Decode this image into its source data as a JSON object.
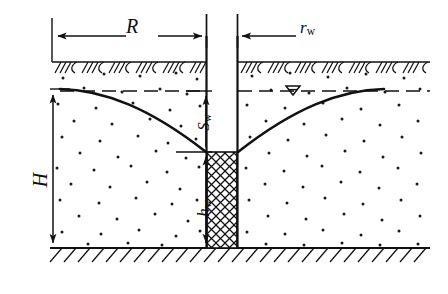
{
  "figure": {
    "type": "engineering-cross-section-diagram",
    "labels": {
      "radius_of_influence": "R",
      "well_radius_symbol": "r",
      "well_radius_subscript": "w",
      "aquifer_thickness": "H",
      "drawdown_symbol": "S",
      "drawdown_subscript": "w",
      "water_depth_symbol": "h",
      "water_depth_subscript": "w",
      "water_table_symbol": "▽"
    },
    "annotations": {
      "radius_of_influence_desc": "Radius of influence measured from well axis to undisturbed water table",
      "well_radius_desc": "Well radius measured from well axis to casing wall",
      "aquifer_thickness_desc": "Original saturated aquifer thickness above impervious base",
      "drawdown_desc": "Drawdown at the well: drop from static water table to well water level",
      "water_depth_desc": "Depth of water remaining in the well above the impervious base"
    },
    "colors": {
      "line": "#111111",
      "background": "#ffffff",
      "soil_dots": "#1a1a1a",
      "hatch": "#111111"
    },
    "elements": [
      "ground-surface-hatching",
      "impervious-base-hatching",
      "static-water-table-dashed-line",
      "drawdown-curve-left",
      "drawdown-curve-right",
      "well-casing",
      "well-filter-screen-crosshatch",
      "soil-dot-fill",
      "dimension-arrow-R",
      "dimension-arrow-rw",
      "dimension-arrow-H",
      "dimension-arrow-Sw",
      "dimension-arrow-hw",
      "water-table-triangle-marker"
    ]
  }
}
